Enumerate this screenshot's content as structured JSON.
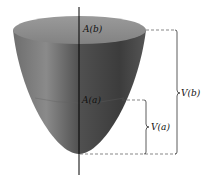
{
  "figure": {
    "labels": {
      "area_top": "A(b)",
      "area_mid": "A(a)",
      "volume_small": "V(a)",
      "volume_large": "V(b)"
    },
    "colors": {
      "top_surface": "#8c8c8c",
      "body_dark": "#4a4a4a",
      "body_light": "#7a7a7a",
      "axis": "#000000",
      "dashed": "#555555"
    }
  }
}
